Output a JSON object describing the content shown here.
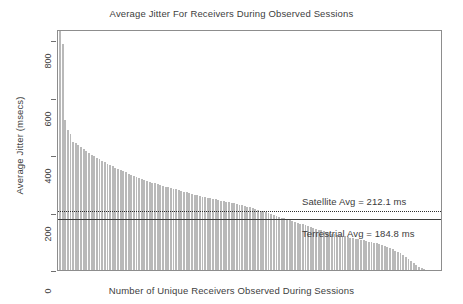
{
  "chart_data": {
    "type": "bar",
    "title": "Average Jitter For Receivers During Observed Sessions",
    "xlabel": "Number of Unique Receivers Observed During Sessions",
    "ylabel": "Average Jitter (msecs)",
    "ylim": [
      0,
      840
    ],
    "xlim": [
      0,
      140
    ],
    "grid": false,
    "legend": "none",
    "y_ticks": [
      0,
      200,
      400,
      600,
      800
    ],
    "y_tick_labels": [
      "0",
      "200",
      "400",
      "600",
      "800"
    ],
    "x_ticks": [],
    "x_tick_labels": [],
    "bar_color": "#b9b9b9",
    "series": [
      {
        "name": "Average jitter per receiver",
        "values": [
          832,
          787,
          522,
          489,
          474,
          447,
          442,
          436,
          429,
          421,
          414,
          407,
          401,
          396,
          391,
          386,
          381,
          376,
          371,
          366,
          362,
          357,
          352,
          348,
          344,
          340,
          336,
          332,
          328,
          325,
          322,
          318,
          315,
          312,
          308,
          305,
          303,
          300,
          297,
          294,
          291,
          288,
          286,
          283,
          281,
          278,
          276,
          273,
          271,
          268,
          266,
          263,
          261,
          259,
          256,
          254,
          252,
          250,
          248,
          246,
          244,
          242,
          240,
          238,
          236,
          234,
          232,
          230,
          228,
          226,
          224,
          221,
          219,
          216,
          213,
          210,
          207,
          204,
          201,
          198,
          195,
          192,
          189,
          186,
          183,
          180,
          177,
          174,
          171,
          168,
          165,
          162,
          159,
          156,
          153,
          150,
          147,
          144,
          141,
          138,
          135,
          132,
          129,
          127,
          125,
          123,
          121,
          119,
          117,
          115,
          113,
          111,
          109,
          107,
          105,
          103,
          101,
          99,
          97,
          95,
          93,
          90,
          87,
          84,
          80,
          76,
          72,
          68,
          63,
          58,
          52,
          46,
          40,
          33,
          26,
          19,
          12,
          6,
          2
        ]
      }
    ],
    "reference_lines": [
      {
        "name": "satellite-average",
        "label": "Satellite Avg = 212.1 ms",
        "value": 212.1,
        "style": "dotted",
        "color": "#2f2f2f"
      },
      {
        "name": "terrestrial-average",
        "label": "Terrestrial Avg = 184.8 ms",
        "value": 184.8,
        "style": "solid",
        "color": "#3c3c3c"
      }
    ]
  }
}
